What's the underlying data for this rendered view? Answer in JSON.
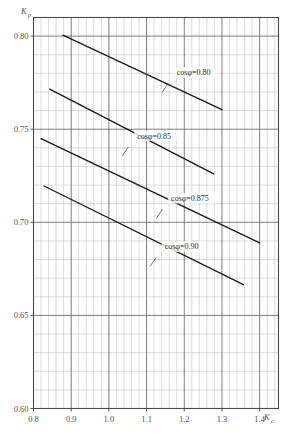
{
  "chart_data": {
    "type": "line",
    "title": "",
    "xlabel": "Kc",
    "ylabel": "Kp",
    "xlim": [
      0.8,
      1.45
    ],
    "ylim": [
      0.6,
      0.81
    ],
    "grid": true,
    "grid_major_x": 0.1,
    "grid_minor_x": 0.02,
    "grid_major_y": 0.05,
    "grid_minor_y": 0.01,
    "legend_position": "inline-labels",
    "xticks": [
      "0.8",
      "0.9",
      "1.0",
      "1.1",
      "1.2",
      "1.3",
      "1.4"
    ],
    "xtick_values": [
      0.8,
      0.9,
      1.0,
      1.1,
      1.2,
      1.3,
      1.4
    ],
    "yticks": [
      "0.80",
      "0.75",
      "0.70",
      "0.65",
      "0.60"
    ],
    "ytick_values": [
      0.8,
      0.75,
      0.7,
      0.65,
      0.6
    ],
    "series": [
      {
        "name": "cosφ=0.80",
        "label": "cosφ=0.80",
        "x": [
          0.878,
          1.3
        ],
        "y": [
          0.8005,
          0.7605
        ],
        "label_x": 1.18,
        "label_y": 0.779,
        "leader_from": [
          1.157,
          0.7745
        ],
        "leader_to": [
          1.142,
          0.77
        ]
      },
      {
        "name": "cosφ=0.85",
        "label": "cosφ=0.85",
        "x": [
          0.843,
          1.278
        ],
        "y": [
          0.7715,
          0.726
        ],
        "label_x": 1.075,
        "label_y": 0.745,
        "leader_from": [
          1.052,
          0.7405
        ],
        "leader_to": [
          1.036,
          0.7358
        ]
      },
      {
        "name": "cosφ=0.875",
        "label": "cosφ=0.875",
        "x": [
          0.82,
          1.4
        ],
        "y": [
          0.745,
          0.689
        ],
        "label_x": 1.165,
        "label_y": 0.7115,
        "leader_from": [
          1.142,
          0.707
        ],
        "leader_to": [
          1.126,
          0.7022
        ]
      },
      {
        "name": "cosφ=0.90",
        "label": "cosφ=0.90",
        "x": [
          0.828,
          1.357
        ],
        "y": [
          0.7195,
          0.6665
        ],
        "label_x": 1.148,
        "label_y": 0.6855,
        "leader_from": [
          1.125,
          0.681
        ],
        "leader_to": [
          1.109,
          0.6763
        ]
      }
    ],
    "colors": {
      "line": "#1a1a1a",
      "grid_minor": "#b9b9b9",
      "grid_major": "#6e6e6e",
      "frame": "#4a4a4a",
      "text": "#555555",
      "background": "#ffffff"
    }
  },
  "axes": {
    "y_label_main": "K",
    "y_label_sub": "p",
    "x_label_main": "K",
    "x_label_sub": "c"
  }
}
